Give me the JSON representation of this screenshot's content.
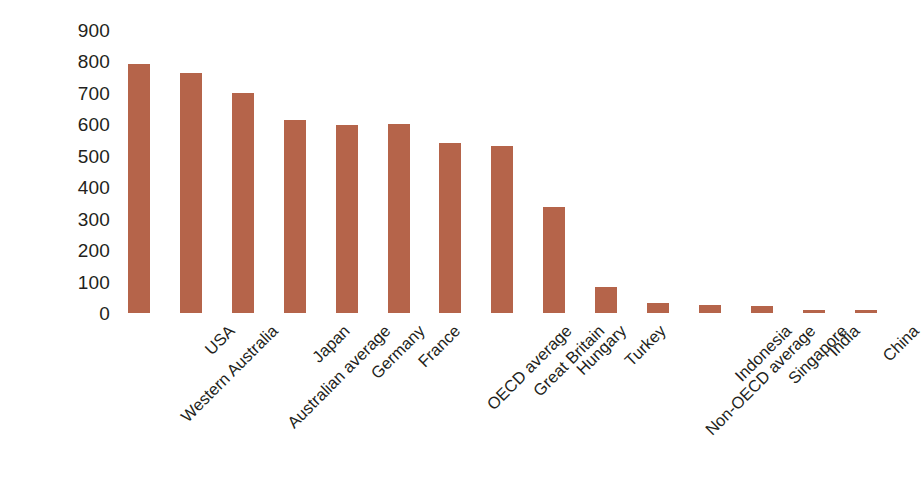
{
  "chart_data": {
    "type": "bar",
    "title": "",
    "subtitle": "",
    "xlabel": "",
    "ylabel": "",
    "ylim": [
      0,
      900
    ],
    "ytick_step": 100,
    "ytick_labels": [
      "900",
      "800",
      "700",
      "600",
      "500",
      "400",
      "300",
      "200",
      "100",
      "0"
    ],
    "grid": false,
    "legend": null,
    "bar_color": "#b5644a",
    "text_color": "#231f20",
    "background_color": "#ffffff",
    "xtick_rotation_degrees": -45,
    "categories": [
      "Western Australia",
      "USA",
      "Australian average",
      "Japan",
      "Germany",
      "France",
      "OECD average",
      "Great Britain",
      "Hungary",
      "Turkey",
      "Non-OECD average",
      "Indonesia",
      "Singapore",
      "India",
      "China"
    ],
    "values": [
      792,
      762,
      700,
      615,
      598,
      600,
      540,
      530,
      337,
      82,
      33,
      26,
      23,
      10,
      10
    ]
  }
}
